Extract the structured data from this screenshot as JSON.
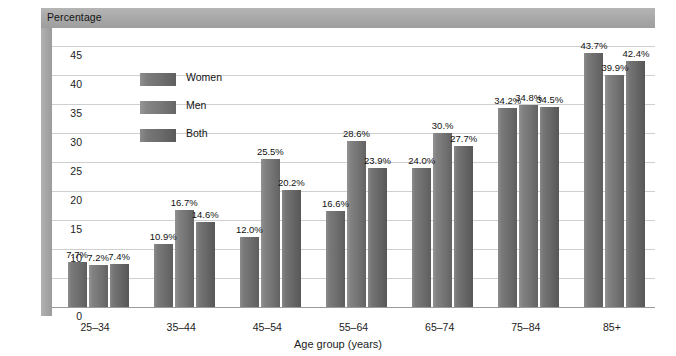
{
  "header": {
    "title": "Percentage"
  },
  "legend": {
    "position": "top-left-inside",
    "items": [
      {
        "label": "Women",
        "swatch_class": "sw-women"
      },
      {
        "label": "Men",
        "swatch_class": "sw-men"
      },
      {
        "label": "Both",
        "swatch_class": "sw-both"
      }
    ]
  },
  "axes": {
    "x_title": "Age group (years)",
    "y_title": "Percentage",
    "y_ticks": [
      "0",
      "5",
      "10",
      "15",
      "20",
      "25",
      "30",
      "35",
      "40",
      "45"
    ]
  },
  "colors": {
    "band_gray": "#a8a8a8",
    "gridline": "#cfcfcf",
    "axis": "#9a9a9a",
    "bar_women": "#6e6e6e",
    "bar_men": "#757575",
    "bar_both": "#686868",
    "text": "#141414",
    "plot_background": "#ffffff"
  },
  "chart_data": {
    "type": "bar",
    "title": "Percentage",
    "xlabel": "Age group (years)",
    "ylabel": "Percentage",
    "ylim": [
      0,
      47
    ],
    "ytick_values": [
      0,
      5,
      10,
      15,
      20,
      25,
      30,
      35,
      40,
      45
    ],
    "grid": true,
    "legend_position": "top-left inside plot",
    "categories": [
      "25–34",
      "35–44",
      "45–54",
      "55–64",
      "65–74",
      "75–84",
      "85+"
    ],
    "series": [
      {
        "name": "Women",
        "values": [
          7.7,
          10.9,
          12.0,
          16.6,
          24.0,
          34.2,
          43.7
        ],
        "labels": [
          "7.7%",
          "10.9%",
          "12.0%",
          "16.6%",
          "24.0%",
          "34.2%",
          "43.7%"
        ]
      },
      {
        "name": "Men",
        "values": [
          7.2,
          16.7,
          25.5,
          28.6,
          30.0,
          34.8,
          39.9
        ],
        "labels": [
          "7.2%",
          "16.7%",
          "25.5%",
          "28.6%",
          "30.%",
          "34.8%",
          "39.9%"
        ]
      },
      {
        "name": "Both",
        "values": [
          7.4,
          14.6,
          20.2,
          23.9,
          27.7,
          34.5,
          42.4
        ],
        "labels": [
          "7.4%",
          "14.6%",
          "20.2%",
          "23.9%",
          "27.7%",
          "34.5%",
          "42.4%"
        ]
      }
    ]
  }
}
